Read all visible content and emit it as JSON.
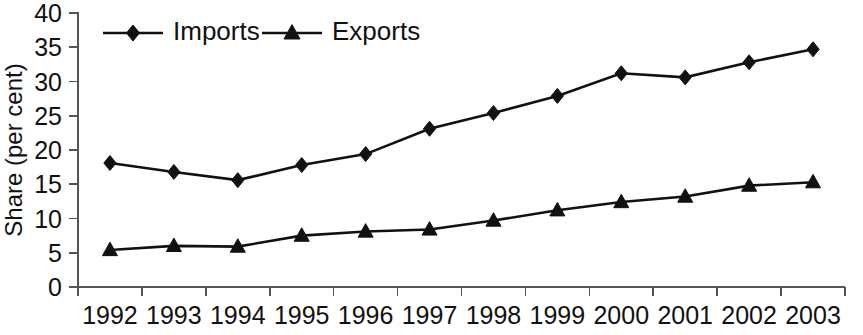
{
  "chart_data": {
    "type": "line",
    "title": "",
    "xlabel": "",
    "ylabel": "Share (per cent)",
    "categories": [
      "1992",
      "1993",
      "1994",
      "1995",
      "1996",
      "1997",
      "1998",
      "1999",
      "2000",
      "2001",
      "2002",
      "2003"
    ],
    "series": [
      {
        "name": "Imports",
        "marker": "diamond",
        "color": "#111111",
        "values": [
          18.1,
          16.8,
          15.6,
          17.8,
          19.4,
          23.1,
          25.4,
          27.9,
          31.2,
          30.6,
          32.8,
          34.7
        ]
      },
      {
        "name": "Exports",
        "marker": "triangle",
        "color": "#111111",
        "values": [
          5.4,
          6.0,
          5.9,
          7.5,
          8.1,
          8.4,
          9.7,
          11.2,
          12.4,
          13.2,
          14.8,
          15.3
        ]
      }
    ],
    "ylim": [
      0,
      40
    ],
    "y_ticks": [
      "0",
      "5",
      "10",
      "15",
      "20",
      "25",
      "30",
      "35",
      "40"
    ],
    "grid": false,
    "legend_position": "top-left-inside"
  },
  "legend": {
    "entries": [
      {
        "label": "Imports",
        "marker": "diamond"
      },
      {
        "label": "Exports",
        "marker": "triangle"
      }
    ]
  }
}
